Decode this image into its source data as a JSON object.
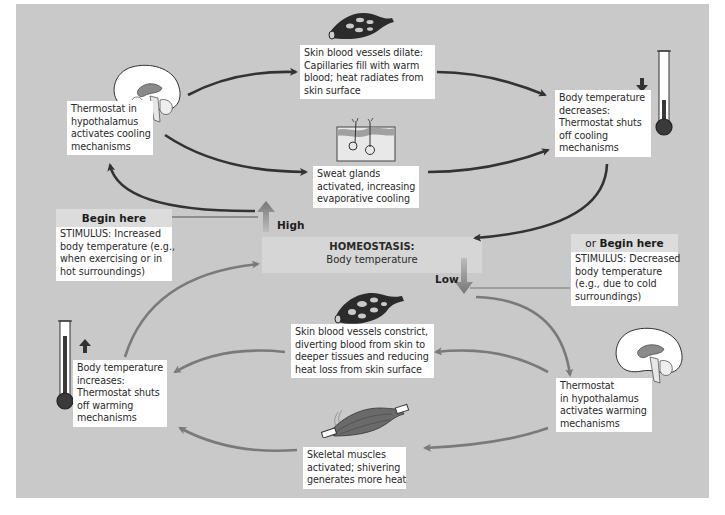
{
  "diagram": {
    "center": {
      "title": "HOMEOSTASIS:",
      "subtitle": "Body temperature",
      "high_label": "High",
      "low_label": "Low"
    },
    "cooling_loop": {
      "stimulus": {
        "header": "Begin here",
        "lines": [
          "STIMULUS: Increased",
          "body temperature (e.g.,",
          "when exercising or in",
          "hot surroundings)"
        ]
      },
      "control_center": {
        "lines": [
          "Thermostat in",
          "hypothalamus",
          "activates cooling",
          "mechanisms"
        ]
      },
      "effector_vessels": {
        "lines": [
          "Skin blood vessels dilate:",
          "Capillaries fill with warm",
          "blood; heat radiates from",
          "skin surface"
        ]
      },
      "effector_sweat": {
        "lines": [
          "Sweat glands",
          "activated, increasing",
          "evaporative cooling"
        ]
      },
      "response": {
        "lines": [
          "Body temperature",
          "decreases:",
          "Thermostat shuts",
          "off cooling",
          "mechanisms"
        ]
      }
    },
    "warming_loop": {
      "stimulus": {
        "header_prefix": "or ",
        "header": "Begin here",
        "lines": [
          "STIMULUS: Decreased",
          "body temperature",
          "(e.g., due to cold",
          "surroundings)"
        ]
      },
      "control_center": {
        "lines": [
          "Thermostat",
          "in hypothalamus",
          "activates warming",
          "mechanisms"
        ]
      },
      "effector_vessels": {
        "lines": [
          "Skin blood vessels constrict,",
          "diverting blood from skin to",
          "deeper tissues and reducing",
          "heat loss from skin surface"
        ]
      },
      "effector_muscles": {
        "lines": [
          "Skeletal muscles",
          "activated; shivering",
          "generates more heat"
        ]
      },
      "response": {
        "lines": [
          "Body temperature",
          "increases:",
          "Thermostat shuts",
          "off warming",
          "mechanisms"
        ]
      }
    },
    "icons": {
      "brain_top": "brain-icon",
      "brain_bottom": "brain-icon",
      "vessels_dilated": "blood-vessel-icon",
      "vessels_constricted": "blood-vessel-icon",
      "sweat_gland": "sweat-gland-icon",
      "muscle": "muscle-icon",
      "thermometer_low": "thermometer-icon",
      "thermometer_high": "thermometer-icon",
      "arrow_down": "arrow-down-icon",
      "arrow_up": "arrow-up-icon"
    },
    "colors": {
      "background": "#c9c9c9",
      "box": "#ffffff",
      "cooling_arrow": "#333333",
      "warming_arrow": "#7a7a7a",
      "thermometer_fill": "#3a3a3a"
    }
  }
}
